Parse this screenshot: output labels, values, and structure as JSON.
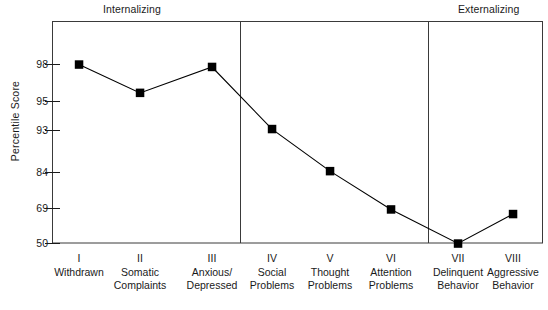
{
  "chart_data": {
    "type": "line",
    "title": "",
    "xlabel": "",
    "ylabel": "Percentile Score",
    "grid": false,
    "legend": "none",
    "ylim": [
      50,
      100
    ],
    "ytick_labels": [
      "98",
      "95",
      "93",
      "84",
      "69",
      "50"
    ],
    "ytick_values": [
      98,
      95,
      93,
      84,
      69,
      50
    ],
    "categories": [
      "I Withdrawn",
      "II Somatic Complaints",
      "III Anxious/Depressed",
      "IV Social Problems",
      "V Thought Problems",
      "VI Attention Problems",
      "VII Delinquent Behavior",
      "VIII Aggressive Behavior"
    ],
    "values": [
      98,
      95.7,
      97.8,
      93.1,
      84.3,
      68.5,
      50,
      66
    ],
    "marker": "filled-square",
    "line_color": "#000000",
    "marker_color": "#000000",
    "annotations": [
      "Internalizing",
      "Externalizing"
    ],
    "group_dividers": [
      3,
      6
    ]
  },
  "bands": {
    "internalizing": "Internalizing",
    "externalizing": "Externalizing"
  },
  "axis": {
    "ylabel": "Percentile Score",
    "yticks": [
      {
        "label": "98"
      },
      {
        "label": "95"
      },
      {
        "label": "93"
      },
      {
        "label": "84"
      },
      {
        "label": "69"
      },
      {
        "label": "50"
      }
    ]
  },
  "categories": [
    {
      "roman": "I",
      "line1": "Withdrawn",
      "line2": ""
    },
    {
      "roman": "II",
      "line1": "Somatic",
      "line2": "Complaints"
    },
    {
      "roman": "III",
      "line1": "Anxious/",
      "line2": "Depressed"
    },
    {
      "roman": "IV",
      "line1": "Social",
      "line2": "Problems"
    },
    {
      "roman": "V",
      "line1": "Thought",
      "line2": "Problems"
    },
    {
      "roman": "VI",
      "line1": "Attention",
      "line2": "Problems"
    },
    {
      "roman": "VII",
      "line1": "Delinquent",
      "line2": "Behavior"
    },
    {
      "roman": "VIII",
      "line1": "Aggressive",
      "line2": "Behavior"
    }
  ],
  "colors": {
    "ink": "#1a1a1a",
    "frame": "#3a3a3a",
    "series": "#000000",
    "background": "#ffffff"
  }
}
